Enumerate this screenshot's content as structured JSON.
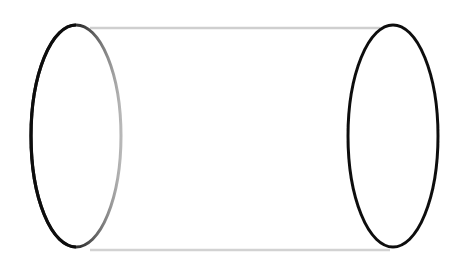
{
  "diagram": {
    "shape": "cylinder",
    "orientation": "horizontal",
    "colors": {
      "background": "#ffffff",
      "stroke": "#111111",
      "stroke_faded": "#b0b0b0"
    },
    "left_cap": {
      "cx": 76,
      "cy": 136,
      "rx": 45,
      "ry": 111
    },
    "right_cap": {
      "cx": 393,
      "cy": 136,
      "rx": 45,
      "ry": 111
    },
    "top_edge": {
      "x1": 73,
      "y1": 25,
      "x2": 391,
      "y2": 25
    },
    "bottom_edge": {
      "x1": 80,
      "y1": 247,
      "x2": 396,
      "y2": 247
    }
  }
}
